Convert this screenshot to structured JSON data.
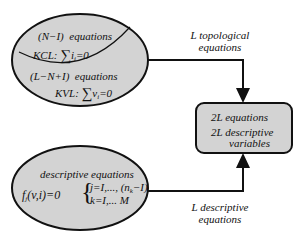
{
  "colors": {
    "fill": "#d3d3d3",
    "stroke": "#111111",
    "background": "#ffffff"
  },
  "top_ellipse": {
    "upper_region": {
      "count_label": "(N−I)",
      "equations_label": "equations",
      "law_label": "KCL:",
      "sum_symbol": "∑",
      "variable": "i",
      "subscript": "i",
      "equals": "=0"
    },
    "lower_region": {
      "count_label": "(L−N+I)",
      "equations_label": "equations",
      "law_label": "KVL:",
      "sum_symbol": "∑",
      "variable": "v",
      "subscript": "i",
      "equals": "=0"
    }
  },
  "bottom_ellipse": {
    "title": "descriptive   equations",
    "function_label": "f",
    "function_subscript": "j",
    "function_args": "(v,i)=0",
    "brace": "{",
    "condition_j": "j=I,..., (n",
    "condition_j_subscript": "k",
    "condition_j_tail": "−I)",
    "condition_k": "k=I,... M"
  },
  "arrow_top": {
    "label_line1": "L   topological",
    "label_line2": "equations"
  },
  "arrow_bottom": {
    "label_line1": "L   descriptive",
    "label_line2": "equations"
  },
  "result_box": {
    "line1": "2L   equations",
    "line2": "2L   descriptive",
    "line3": "variables"
  }
}
